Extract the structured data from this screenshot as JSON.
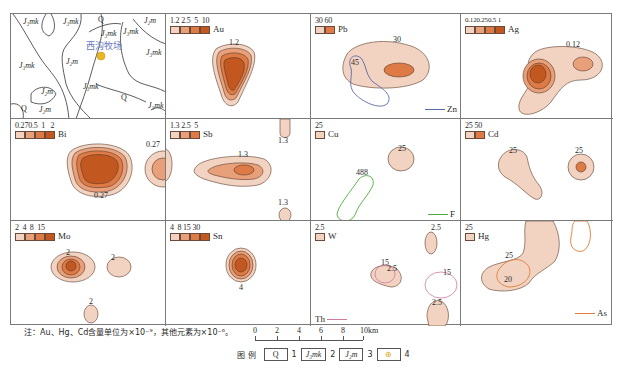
{
  "geology_panel": {
    "labels": [
      {
        "text": "J₃mk",
        "x": 12,
        "y": 4
      },
      {
        "text": "J₃mk",
        "x": 52,
        "y": 4
      },
      {
        "text": "Q",
        "x": 87,
        "y": 2
      },
      {
        "text": "J₂m",
        "x": 133,
        "y": 3
      },
      {
        "text": "J₃mk",
        "x": 90,
        "y": 16
      },
      {
        "text": "J₃mk",
        "x": 112,
        "y": 14
      },
      {
        "text": "J₃mk",
        "x": 135,
        "y": 35
      },
      {
        "text": "J₃mk",
        "x": 8,
        "y": 48
      },
      {
        "text": "J₂m",
        "x": 55,
        "y": 44
      },
      {
        "text": "J₃mk",
        "x": 72,
        "y": 69
      },
      {
        "text": "J₂m",
        "x": 30,
        "y": 74
      },
      {
        "text": "Q",
        "x": 110,
        "y": 80
      },
      {
        "text": "Q",
        "x": 10,
        "y": 91
      },
      {
        "text": "J₂m",
        "x": 28,
        "y": 92
      },
      {
        "text": "J₃mk",
        "x": 137,
        "y": 88
      }
    ],
    "place_name": "西沟牧场"
  },
  "panels": [
    {
      "element": "Au",
      "legend_values": [
        "1.2",
        "2.5",
        "5",
        "10"
      ],
      "contour_labels": [
        "1.2"
      ]
    },
    {
      "element": "Pb",
      "legend_values": [
        "30",
        "60"
      ],
      "contour_labels": [
        "30",
        "45"
      ],
      "line_key": "Zn"
    },
    {
      "element": "Ag",
      "legend_values": [
        "0.12",
        "0.25",
        "0.5",
        "1"
      ],
      "contour_labels": [
        "0.12"
      ]
    },
    {
      "element": "Bi",
      "legend_values": [
        "0.27",
        "0.5",
        "1",
        "2"
      ],
      "contour_labels": [
        "0.27",
        "0.27"
      ]
    },
    {
      "element": "Sb",
      "legend_values": [
        "1.3",
        "2.5",
        "5"
      ],
      "contour_labels": [
        "1.3",
        "1.3",
        "1.3"
      ]
    },
    {
      "element": "Cu",
      "legend_values": [
        "25"
      ],
      "contour_labels": [
        "25",
        "488"
      ],
      "line_key": "F"
    },
    {
      "element": "Cd",
      "legend_values": [
        "25",
        "50"
      ],
      "contour_labels": [
        "25",
        "25"
      ]
    },
    {
      "element": "Mo",
      "legend_values": [
        "2",
        "4",
        "8",
        "15"
      ],
      "contour_labels": [
        "2",
        "2",
        "2"
      ]
    },
    {
      "element": "Sn",
      "legend_values": [
        "4",
        "8",
        "15",
        "30"
      ],
      "contour_labels": [
        "4"
      ]
    },
    {
      "element": "W",
      "legend_values": [
        "2.5"
      ],
      "contour_labels": [
        "2.5",
        "15",
        "2.5",
        "15",
        "2.5"
      ],
      "line_key": "Th"
    },
    {
      "element": "Hg",
      "legend_values": [
        "25"
      ],
      "contour_labels": [
        "25",
        "20"
      ],
      "line_key": "As"
    }
  ],
  "colors": {
    "level1": "#f2d3c1",
    "level2": "#e8a07a",
    "level3": "#dd7a45",
    "level4": "#c2571f",
    "zn_line": "#5a6aa8",
    "f_line": "#4caa3a",
    "th_line": "#d07aa0",
    "as_line": "#e07a3a",
    "outline": "#5a3a2a"
  },
  "note": "注：Au、Hg、Cd含量单位为×10⁻⁹，其他元素为×10⁻⁶。",
  "scale_bar": {
    "ticks": [
      "0",
      "2",
      "4",
      "6",
      "8",
      "10km"
    ]
  },
  "map_legend": {
    "title": "图  例",
    "items": [
      {
        "symbol": "Q",
        "num": "1"
      },
      {
        "symbol": "J₃mk",
        "num": "2"
      },
      {
        "symbol": "J₂m",
        "num": "3"
      },
      {
        "symbol": "⊕",
        "num": "4"
      }
    ]
  }
}
